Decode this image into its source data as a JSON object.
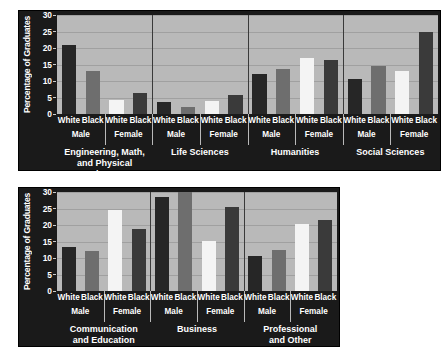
{
  "chart_data": [
    {
      "type": "bar",
      "title": "",
      "xlabel": "",
      "ylabel": "Percentage of Graduates",
      "ylim": [
        0,
        30
      ],
      "yticks": [
        0,
        5,
        10,
        15,
        20,
        25,
        30
      ],
      "grid": true,
      "legend": "none",
      "panel": "top",
      "categories": [
        "Engineering, Math,\nand Physical Sciences",
        "Life Sciences",
        "Humanities",
        "Social Sciences"
      ],
      "subgroups": [
        "Male",
        "Female"
      ],
      "races": [
        "White",
        "Black"
      ],
      "series": [
        {
          "name": "White Male",
          "color": "#262626",
          "values": [
            21.0,
            3.7,
            12.1,
            10.6
          ]
        },
        {
          "name": "Black Male",
          "color": "#6e6e6e",
          "values": [
            13.0,
            2.2,
            13.7,
            14.4
          ]
        },
        {
          "name": "White Female",
          "color": "#f4f4f4",
          "values": [
            4.2,
            3.9,
            17.0,
            13.1
          ]
        },
        {
          "name": "Black Female",
          "color": "#3a3a3a",
          "values": [
            6.5,
            5.7,
            16.4,
            25.0
          ]
        }
      ]
    },
    {
      "type": "bar",
      "title": "",
      "xlabel": "",
      "ylabel": "Percentage of Graduates",
      "ylim": [
        0,
        30
      ],
      "yticks": [
        0,
        5,
        10,
        15,
        20,
        25,
        30
      ],
      "grid": true,
      "legend": "none",
      "panel": "bottom",
      "categories": [
        "Communication\nand Education",
        "Business",
        "Professional\nand Other"
      ],
      "subgroups": [
        "Male",
        "Female"
      ],
      "races": [
        "White",
        "Black"
      ],
      "series": [
        {
          "name": "White Male",
          "color": "#262626",
          "values": [
            13.3,
            28.6,
            10.7
          ]
        },
        {
          "name": "Black Male",
          "color": "#6e6e6e",
          "values": [
            12.1,
            30.4,
            12.5
          ]
        },
        {
          "name": "White Female",
          "color": "#f4f4f4",
          "values": [
            24.7,
            15.1,
            20.2
          ]
        },
        {
          "name": "Black Female",
          "color": "#3a3a3a",
          "values": [
            18.8,
            25.5,
            21.6
          ]
        }
      ]
    }
  ],
  "colors": {
    "panel_background": "#1a1a1a",
    "plot_background": "#b9b9b9",
    "gridline": "#a0a0a0",
    "white_male_bar": "#262626",
    "black_male_bar": "#6e6e6e",
    "white_female_bar": "#f4f4f4",
    "black_female_bar": "#3a3a3a",
    "label_text": "#ffffff",
    "page_background": "#ffffff"
  }
}
